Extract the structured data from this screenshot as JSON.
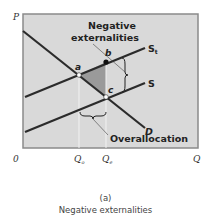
{
  "diagram": {
    "axis": {
      "y_label": "P",
      "x_label": "Q",
      "origin": "0"
    },
    "x_ticks": [
      {
        "label": "Q",
        "sub": "o"
      },
      {
        "label": "Q",
        "sub": "e"
      }
    ],
    "curves": {
      "st": {
        "label": "S",
        "sub": "t"
      },
      "s": {
        "label": "S"
      },
      "d": {
        "label": "D"
      }
    },
    "points": {
      "a": "a",
      "b": "b",
      "c": "c"
    },
    "annotations": {
      "negative_line1": "Negative",
      "negative_line2": "externalities",
      "overallocation": "Overallocation"
    },
    "colors": {
      "plot_bg": "#d9d9d9",
      "border": "#8a8a8a",
      "line": "#2b2b2b",
      "shade": "#9a9a9a",
      "guide": "#f2f2f2"
    }
  },
  "caption": {
    "panel": "(a)",
    "title": "Negative externalities"
  }
}
